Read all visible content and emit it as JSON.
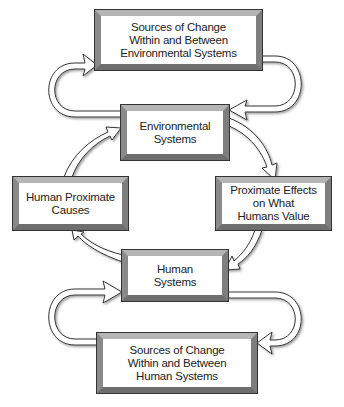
{
  "diagram": {
    "nodes": {
      "env_sources": {
        "label": "Sources of Change\nWithin and Between\nEnvironmental Systems"
      },
      "env_systems": {
        "label": "Environmental\nSystems"
      },
      "human_causes": {
        "label": "Human Proximate\nCauses"
      },
      "proximate_effects": {
        "label": "Proximate Effects\non What\nHumans Value"
      },
      "human_systems": {
        "label": "Human\nSystems"
      },
      "human_sources": {
        "label": "Sources of Change\nWithin and Between\nHuman Systems"
      }
    },
    "edges": [
      {
        "from": "env_systems",
        "to": "env_sources",
        "side": "left"
      },
      {
        "from": "env_sources",
        "to": "env_systems",
        "side": "right"
      },
      {
        "from": "env_systems",
        "to": "proximate_effects"
      },
      {
        "from": "proximate_effects",
        "to": "human_systems"
      },
      {
        "from": "human_systems",
        "to": "human_causes"
      },
      {
        "from": "human_causes",
        "to": "env_systems"
      },
      {
        "from": "human_sources",
        "to": "human_systems",
        "side": "left"
      },
      {
        "from": "human_systems",
        "to": "human_sources",
        "side": "right"
      }
    ]
  }
}
